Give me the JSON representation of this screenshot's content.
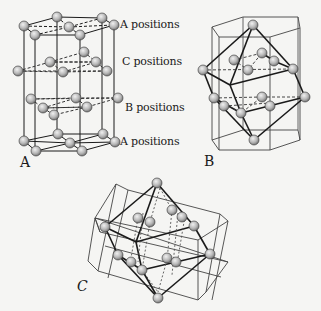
{
  "figure": {
    "background": "#f5f5f3",
    "ink_color": "#1a1a1a",
    "atom_fill": "#bdbdbd"
  },
  "panels": [
    {
      "id": "A",
      "label": "A"
    },
    {
      "id": "B",
      "label": "B"
    },
    {
      "id": "C",
      "label": "C"
    }
  ],
  "panel_a_layers": [
    {
      "label": "A positions",
      "position": "top"
    },
    {
      "label": "C positions",
      "position": "upper-middle"
    },
    {
      "label": "B positions",
      "position": "lower-middle"
    },
    {
      "label": "A positions",
      "position": "bottom"
    }
  ]
}
